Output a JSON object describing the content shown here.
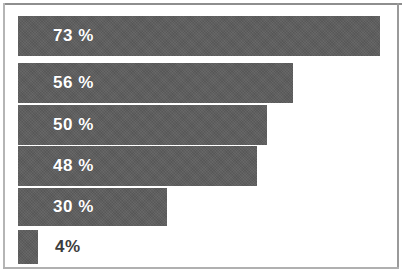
{
  "chart_data": {
    "type": "bar",
    "orientation": "horizontal",
    "title": "",
    "subtitle": "",
    "xlabel": "",
    "ylabel": "",
    "xlim": [
      0,
      100
    ],
    "grid": false,
    "legend": null,
    "categories": [
      "",
      "",
      "",
      "",
      "",
      ""
    ],
    "values": [
      73,
      56,
      50,
      48,
      30,
      4
    ],
    "data_labels": [
      "73 %",
      "56 %",
      "50 %",
      "48 %",
      "30 %",
      "4%"
    ],
    "bar_color": "#5c5c5c",
    "label_color_inside": "#ffffff",
    "label_color_outside": "#3d3d3d",
    "background_color": "#ffffff",
    "border_color": "#9a9a9a",
    "bars": [
      {
        "value": 73,
        "label": "73 %",
        "label_position": "inside",
        "top": 16,
        "height": 40,
        "width": 362
      },
      {
        "value": 56,
        "label": "56 %",
        "label_position": "inside",
        "top": 63,
        "height": 40,
        "width": 275
      },
      {
        "value": 50,
        "label": "50 %",
        "label_position": "inside",
        "top": 105,
        "height": 40,
        "width": 249
      },
      {
        "value": 48,
        "label": "48 %",
        "label_position": "inside",
        "top": 146,
        "height": 40,
        "width": 239
      },
      {
        "value": 30,
        "label": "30 %",
        "label_position": "inside",
        "top": 188,
        "height": 38,
        "width": 149
      },
      {
        "value": 4,
        "label": "4%",
        "label_position": "outside",
        "top": 230,
        "height": 34,
        "width": 20
      }
    ]
  }
}
